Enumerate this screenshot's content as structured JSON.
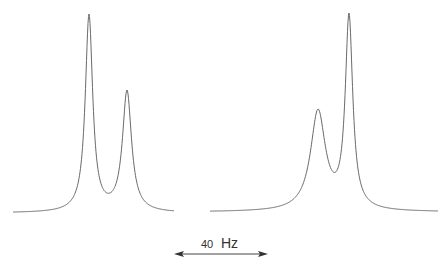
{
  "chart_data": {
    "type": "line",
    "title": "",
    "xlabel": "",
    "ylabel": "",
    "grid": false,
    "legend": null,
    "spectra": [
      {
        "name": "left-spectrum",
        "baseline_y_px": 213,
        "x_range_px": [
          13,
          174
        ],
        "peaks": [
          {
            "x_px": 89,
            "top_y_px": 14,
            "relative_height": 1.0,
            "width_px": 4.5
          },
          {
            "x_px": 127,
            "top_y_px": 90,
            "relative_height": 0.62,
            "width_px": 5.5
          }
        ],
        "valley": {
          "x_px": 105,
          "y_px": 202
        }
      },
      {
        "name": "right-spectrum",
        "baseline_y_px": 212,
        "x_range_px": [
          210,
          438
        ],
        "peaks": [
          {
            "x_px": 318,
            "top_y_px": 109,
            "relative_height": 0.52,
            "width_px": 9
          },
          {
            "x_px": 349,
            "top_y_px": 13,
            "relative_height": 1.0,
            "width_px": 4.5
          }
        ],
        "valley": {
          "x_px": 333,
          "y_px": 157
        }
      }
    ],
    "annotations": [
      {
        "text": "40 Hz",
        "type": "scale-bar",
        "value": 40,
        "unit": "Hz",
        "x1_px": 175,
        "x2_px": 267,
        "y_px": 254
      }
    ]
  },
  "scale_bar": {
    "number": "40",
    "unit": "Hz"
  }
}
